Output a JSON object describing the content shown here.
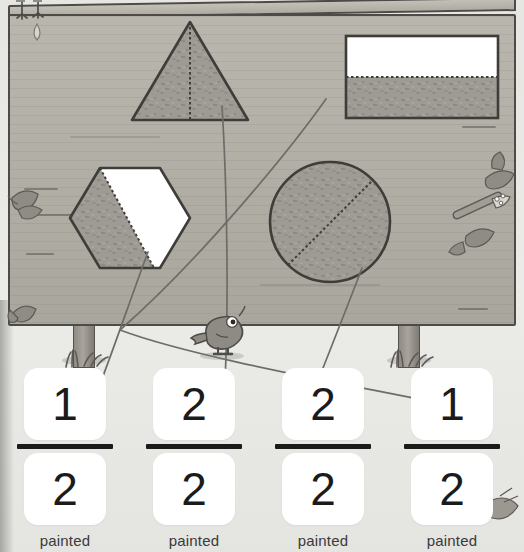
{
  "scene": {
    "title": "Fractions painted shapes matching worksheet",
    "background_color": "#e8e8e6",
    "board_color": "#b3b0a8",
    "board_outline_color": "#4e4b46",
    "paint_fill_color": "#9b9893",
    "unpainted_color": "#ffffff",
    "connector_color": "#6e6c68"
  },
  "board": {
    "shapes": [
      {
        "id": "triangle",
        "name": "triangle",
        "painted_parts": 2,
        "total_parts": 2,
        "fraction_label": "2/2",
        "divider": "dotted-vertical",
        "fully_painted": true
      },
      {
        "id": "rectangle",
        "name": "rectangle",
        "painted_parts": 1,
        "total_parts": 2,
        "fraction_label": "1/2",
        "divider": "dotted-horizontal",
        "fully_painted": false
      },
      {
        "id": "hexagon",
        "name": "hexagon",
        "painted_parts": 1,
        "total_parts": 2,
        "fraction_label": "1/2",
        "divider": "dotted-diagonal",
        "fully_painted": false
      },
      {
        "id": "circle",
        "name": "circle",
        "painted_parts": 2,
        "total_parts": 2,
        "fraction_label": "2/2",
        "divider": "dotted-diagonal",
        "fully_painted": true
      }
    ]
  },
  "answer_cards": [
    {
      "id": "card-1",
      "numerator": "1",
      "denominator": "2",
      "caption": "painted"
    },
    {
      "id": "card-2",
      "numerator": "2",
      "denominator": "2",
      "caption": "painted"
    },
    {
      "id": "card-3",
      "numerator": "2",
      "denominator": "2",
      "caption": "painted"
    },
    {
      "id": "card-4",
      "numerator": "1",
      "denominator": "2",
      "caption": "painted"
    }
  ],
  "connectors": [
    {
      "id": "connector-hexagon",
      "from_shape": "hexagon",
      "to_card": "card-1"
    },
    {
      "id": "connector-triangle",
      "from_shape": "triangle",
      "to_card": "card-2"
    },
    {
      "id": "connector-circle",
      "from_shape": "circle",
      "to_card": "card-3"
    },
    {
      "id": "connector-rectangle",
      "from_shape": "rectangle",
      "to_card": "card-4"
    }
  ],
  "decorations": [
    {
      "id": "bird",
      "name": "bird"
    },
    {
      "id": "bird-feet",
      "name": "bird-feet"
    },
    {
      "id": "paint-drip",
      "name": "paint-drip"
    },
    {
      "id": "paintbrush",
      "name": "paintbrush"
    },
    {
      "id": "leaf-left-upper",
      "name": "leaf"
    },
    {
      "id": "leaf-left-lower",
      "name": "leaf"
    },
    {
      "id": "leaf-right",
      "name": "leaf"
    },
    {
      "id": "leaf-bottom-right",
      "name": "leaf"
    },
    {
      "id": "grass-left",
      "name": "grass-tuft"
    },
    {
      "id": "grass-right",
      "name": "grass-tuft"
    }
  ]
}
